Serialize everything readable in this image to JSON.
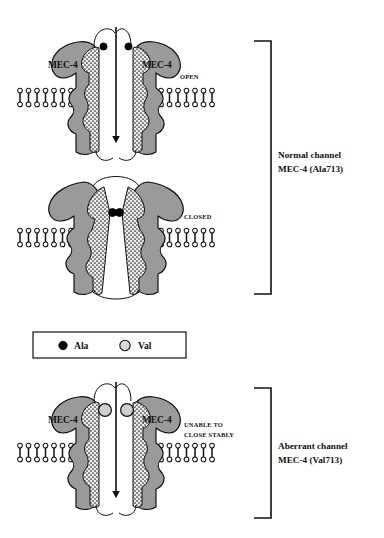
{
  "figure": {
    "background_color": "#ffffff",
    "protein_fill": "#9a9a9a",
    "protein_stroke": "#111111",
    "stipple_fill": "#e8e8e8",
    "ala_color": "#000000",
    "val_fill": "#d0d0d0",
    "val_stroke": "#111111",
    "line_color": "#111111"
  },
  "panels": [
    {
      "id": "open",
      "state_label": "OPEN",
      "subunit_left_label": "MEC-4",
      "subunit_right_label": "MEC-4",
      "residue_type": "Ala",
      "residue_count": 2,
      "pore_open": true
    },
    {
      "id": "closed",
      "state_label": "CLOSED",
      "subunit_left_label": "",
      "subunit_right_label": "",
      "residue_type": "Ala",
      "residue_count": 2,
      "pore_open": false
    },
    {
      "id": "aberrant",
      "state_label_line1": "UNABLE TO",
      "state_label_line2": "CLOSE STABLY",
      "subunit_left_label": "MEC-4",
      "subunit_right_label": "MEC-4",
      "residue_type": "Val",
      "residue_count": 2,
      "pore_open": true
    }
  ],
  "legend": {
    "items": [
      {
        "marker": "filled-circle",
        "label": "Ala"
      },
      {
        "marker": "open-circle",
        "label": "Val"
      }
    ]
  },
  "brackets": [
    {
      "id": "normal",
      "line1": "Normal channel",
      "line2": "MEC-4 (Ala713)"
    },
    {
      "id": "aberrant",
      "line1": "Aberrant channel",
      "line2": "MEC-4 (Val713)"
    }
  ]
}
